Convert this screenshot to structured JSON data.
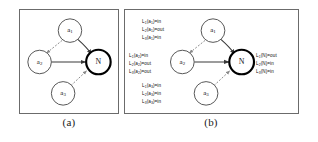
{
  "figure": {
    "panels": [
      {
        "id": "a",
        "caption": "(a)"
      },
      {
        "id": "b",
        "caption": "(b)"
      }
    ]
  },
  "graph": {
    "nodes": [
      {
        "id": "a1",
        "label": "a",
        "sub": "1",
        "emphasis": false
      },
      {
        "id": "a2",
        "label": "a",
        "sub": "2",
        "emphasis": false
      },
      {
        "id": "a3",
        "label": "a",
        "sub": "3",
        "emphasis": false
      },
      {
        "id": "n",
        "label": "N",
        "sub": "",
        "emphasis": true
      }
    ],
    "edges": [
      {
        "from": "a1",
        "to": "n",
        "style": "solid"
      },
      {
        "from": "a2",
        "to": "n",
        "style": "solid"
      },
      {
        "from": "a1",
        "to": "a2",
        "style": "dashed"
      },
      {
        "from": "a3",
        "to": "n",
        "style": "dashed"
      }
    ]
  },
  "annotations": {
    "a1": [
      {
        "fn": "L",
        "fn_sub": "1",
        "arg": "a",
        "arg_sub": "1",
        "value": "in"
      },
      {
        "fn": "L",
        "fn_sub": "2",
        "arg": "a",
        "arg_sub": "1",
        "value": "out"
      },
      {
        "fn": "L",
        "fn_sub": "3",
        "arg": "a",
        "arg_sub": "1",
        "value": "in"
      }
    ],
    "a2": [
      {
        "fn": "L",
        "fn_sub": "1",
        "arg": "a",
        "arg_sub": "2",
        "value": "in"
      },
      {
        "fn": "L",
        "fn_sub": "2",
        "arg": "a",
        "arg_sub": "2",
        "value": "out"
      },
      {
        "fn": "L",
        "fn_sub": "3",
        "arg": "a",
        "arg_sub": "2",
        "value": "out"
      }
    ],
    "a3": [
      {
        "fn": "L",
        "fn_sub": "1",
        "arg": "a",
        "arg_sub": "3",
        "value": "in"
      },
      {
        "fn": "L",
        "fn_sub": "2",
        "arg": "a",
        "arg_sub": "3",
        "value": "in"
      },
      {
        "fn": "L",
        "fn_sub": "3",
        "arg": "a",
        "arg_sub": "3",
        "value": "in"
      }
    ],
    "n": [
      {
        "fn": "L",
        "fn_sub": "1",
        "arg": "N",
        "arg_sub": "",
        "value": "out"
      },
      {
        "fn": "L",
        "fn_sub": "2",
        "arg": "N",
        "arg_sub": "",
        "value": "in"
      },
      {
        "fn": "L",
        "fn_sub": "3",
        "arg": "N",
        "arg_sub": "",
        "value": "in"
      }
    ]
  },
  "colors": {
    "panel_border": "#6b6b6b",
    "node_stroke": "#555555",
    "node_emphasis_stroke": "#000000",
    "edge_solid": "#3a3a3a",
    "edge_dashed": "#8a8a8a",
    "text": "#111111",
    "background": "#ffffff"
  }
}
